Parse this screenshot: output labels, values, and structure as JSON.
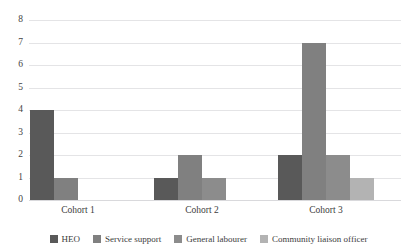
{
  "chart_data": {
    "type": "bar",
    "title": "",
    "subtitle": "",
    "xlabel": "",
    "ylabel": "",
    "categories": [
      "Cohort 1",
      "Cohort 2",
      "Cohort 3"
    ],
    "series": [
      {
        "name": "HEO",
        "values": [
          4,
          1,
          2
        ],
        "color": "#595959"
      },
      {
        "name": "Service support",
        "values": [
          1,
          2,
          7
        ],
        "color": "#808080"
      },
      {
        "name": "General labourer",
        "values": [
          0,
          1,
          2
        ],
        "color": "#8c8c8c"
      },
      {
        "name": "Community liaison officer",
        "values": [
          0,
          0,
          1
        ],
        "color": "#b3b3b3"
      }
    ],
    "ylim": [
      0,
      8
    ],
    "yticks": [
      0,
      1,
      2,
      3,
      4,
      5,
      6,
      7,
      8
    ],
    "ytick_labels": [
      "0",
      "1",
      "2",
      "3",
      "4",
      "5",
      "6",
      "7",
      "8"
    ],
    "grid": true,
    "legend_position": "bottom",
    "gridline_color": "#e4e4e6",
    "background_color": "#ffffff"
  }
}
